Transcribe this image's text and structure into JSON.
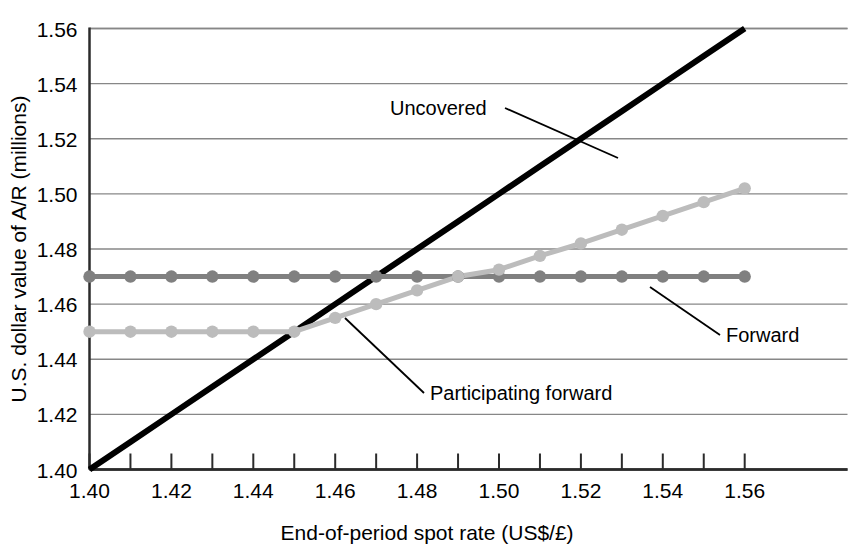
{
  "chart_data": {
    "type": "line",
    "title": "",
    "xlabel": "End-of-period spot rate (US$/£)",
    "ylabel": "U.S. dollar value of A/R (millions)",
    "xlim": [
      1.4,
      1.56
    ],
    "ylim": [
      1.4,
      1.56
    ],
    "xticks": [
      "1.40",
      "1.42",
      "1.44",
      "1.46",
      "1.48",
      "1.50",
      "1.52",
      "1.54",
      "1.56"
    ],
    "xtick_values": [
      1.4,
      1.42,
      1.44,
      1.46,
      1.48,
      1.5,
      1.52,
      1.54,
      1.56
    ],
    "yticks": [
      "1.40",
      "1.42",
      "1.44",
      "1.46",
      "1.48",
      "1.50",
      "1.52",
      "1.54",
      "1.56"
    ],
    "ytick_values": [
      1.4,
      1.42,
      1.44,
      1.46,
      1.48,
      1.5,
      1.52,
      1.54,
      1.56
    ],
    "minor_xticks": [
      1.41,
      1.43,
      1.45,
      1.47,
      1.49,
      1.51,
      1.53,
      1.55
    ],
    "grid": "horizontal",
    "legend_position": "inline-annotations",
    "x": [
      1.4,
      1.41,
      1.42,
      1.43,
      1.44,
      1.45,
      1.46,
      1.47,
      1.48,
      1.49,
      1.5,
      1.51,
      1.52,
      1.53,
      1.54,
      1.55,
      1.56
    ],
    "series": [
      {
        "name": "Uncovered",
        "color": "#000000",
        "linewidth": 6,
        "markers": false,
        "values": [
          1.4,
          1.41,
          1.42,
          1.43,
          1.44,
          1.45,
          1.46,
          1.47,
          1.48,
          1.49,
          1.5,
          1.51,
          1.52,
          1.53,
          1.54,
          1.55,
          1.56
        ]
      },
      {
        "name": "Forward",
        "color": "#808080",
        "linewidth": 5,
        "markers": true,
        "values": [
          1.47,
          1.47,
          1.47,
          1.47,
          1.47,
          1.47,
          1.47,
          1.47,
          1.47,
          1.47,
          1.47,
          1.47,
          1.47,
          1.47,
          1.47,
          1.47,
          1.47
        ]
      },
      {
        "name": "Participating forward",
        "color": "#bcbcbc",
        "linewidth": 5,
        "markers": true,
        "values": [
          1.45,
          1.45,
          1.45,
          1.45,
          1.45,
          1.45,
          1.455,
          1.46,
          1.465,
          1.47,
          1.4725,
          1.4775,
          1.482,
          1.487,
          1.492,
          1.497,
          1.502
        ]
      }
    ],
    "annotations": [
      {
        "text": "Uncovered",
        "label_x": 390,
        "label_y": 115,
        "anchor": "start",
        "leader": [
          [
            505,
            108
          ],
          [
            618,
            158
          ]
        ]
      },
      {
        "text": "Forward",
        "label_x": 726,
        "label_y": 342,
        "anchor": "start",
        "leader": [
          [
            720,
            335
          ],
          [
            650,
            287
          ]
        ]
      },
      {
        "text": "Participating forward",
        "label_x": 430,
        "label_y": 400,
        "anchor": "start",
        "leader": [
          [
            424,
            393
          ],
          [
            345,
            318
          ]
        ]
      }
    ]
  }
}
